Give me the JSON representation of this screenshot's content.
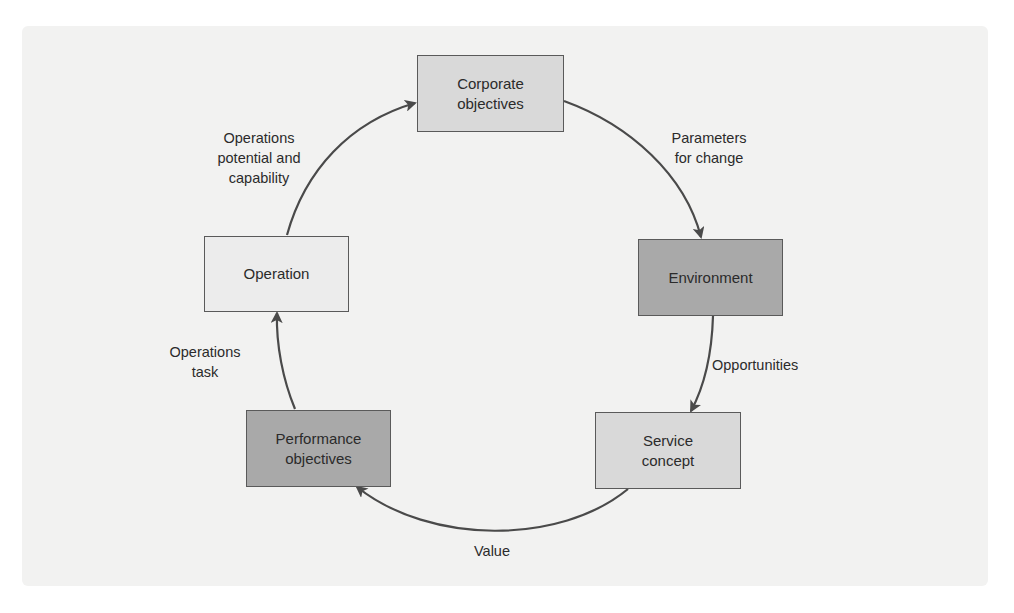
{
  "diagram": {
    "type": "cycle",
    "colors": {
      "background": "#f2f2f1",
      "edge": "#4a4a4a",
      "node_light": "#ececec",
      "node_medium": "#d9d9d9",
      "node_dark": "#a9a9a9",
      "text": "#2b2b2b"
    },
    "nodes": [
      {
        "id": "corporate",
        "label": "Corporate\nobjectives",
        "shade": "medium"
      },
      {
        "id": "environment",
        "label": "Environment",
        "shade": "dark"
      },
      {
        "id": "service",
        "label": "Service\nconcept",
        "shade": "medium"
      },
      {
        "id": "performance",
        "label": "Performance\nobjectives",
        "shade": "dark"
      },
      {
        "id": "operation",
        "label": "Operation",
        "shade": "light"
      }
    ],
    "edges": [
      {
        "from": "corporate",
        "to": "environment",
        "label": "Parameters\nfor change"
      },
      {
        "from": "environment",
        "to": "service",
        "label": "Opportunities"
      },
      {
        "from": "service",
        "to": "performance",
        "label": "Value"
      },
      {
        "from": "performance",
        "to": "operation",
        "label": "Operations\ntask"
      },
      {
        "from": "operation",
        "to": "corporate",
        "label": "Operations\npotential and\ncapability"
      }
    ]
  }
}
